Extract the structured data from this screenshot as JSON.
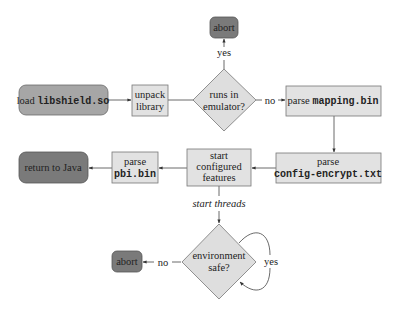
{
  "diagram": {
    "type": "flowchart",
    "colors": {
      "light_fill": "#e2e2e2",
      "mid_fill": "#a6a6a6",
      "dark_fill": "#7a7a7a",
      "diamond_fill": "#dedede",
      "stroke": "#777777"
    },
    "nodes": {
      "load": {
        "prefix": "load ",
        "code": "libshield.so"
      },
      "unpack": {
        "line1": "unpack",
        "line2": "library"
      },
      "emulator": {
        "line1": "runs in",
        "line2": "emulator?"
      },
      "abort_top": {
        "label": "abort"
      },
      "parse_mapping": {
        "prefix": "parse ",
        "code": "mapping.bin"
      },
      "parse_config": {
        "line1": "parse",
        "code": "config-encrypt.txt"
      },
      "start_features": {
        "line1": "start",
        "line2": "configured",
        "line3": "features"
      },
      "parse_pbi": {
        "line1": "parse",
        "code": "pbi.bin"
      },
      "return_java": {
        "label": "return to Java"
      },
      "env_safe": {
        "line1": "environment",
        "line2": "safe?"
      },
      "abort_bottom": {
        "label": "abort"
      }
    },
    "edges": {
      "emulator_yes": "yes",
      "emulator_no": "no",
      "start_threads": "start threads",
      "env_no": "no",
      "env_yes": "yes"
    }
  }
}
